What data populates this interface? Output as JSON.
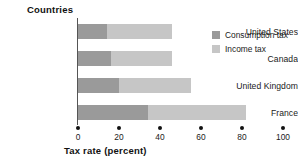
{
  "chart_data": {
    "type": "bar",
    "orientation": "horizontal",
    "stacked": true,
    "title": "",
    "categories": [
      "United States",
      "Canada",
      "United Kingdom",
      "France"
    ],
    "series": [
      {
        "name": "Consumption tax",
        "values": [
          14,
          16,
          20,
          34
        ],
        "color": "#9a9a9a"
      },
      {
        "name": "Income tax",
        "values": [
          32,
          30,
          35,
          48
        ],
        "color": "#c6c6c6"
      }
    ],
    "totals": [
      46,
      46,
      55,
      82
    ],
    "xlabel": "Tax rate (percent)",
    "ylabel": "Countries",
    "xlim": [
      0,
      100
    ],
    "xticks": [
      0,
      20,
      40,
      60,
      80,
      100
    ],
    "xtick_labels": [
      "0",
      "20",
      "40",
      "60",
      "80",
      "100"
    ],
    "grid": false,
    "legend_position": "top-right"
  },
  "axis": {
    "y_title": "Countries",
    "x_title": "Tax rate (percent)"
  },
  "legend": {
    "items": [
      {
        "label": "Consumption tax",
        "color": "#9a9a9a"
      },
      {
        "label": "Income tax",
        "color": "#c6c6c6"
      }
    ]
  }
}
